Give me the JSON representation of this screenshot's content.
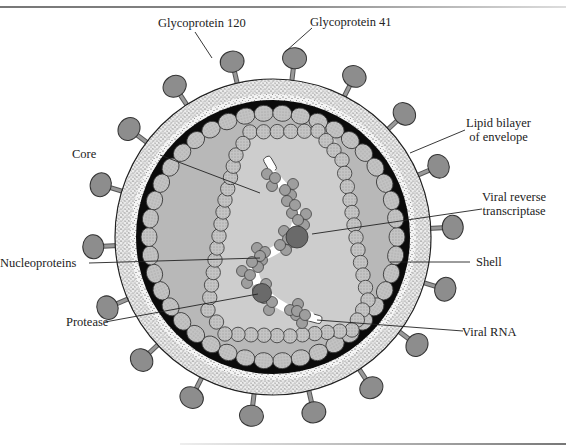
{
  "diagram": {
    "labels": [
      {
        "id": "gp120",
        "text": "Glycoprotein 120"
      },
      {
        "id": "gp41",
        "text": "Glycoprotein 41"
      },
      {
        "id": "lipid",
        "line1": "Lipid bilayer",
        "line2": "of envelope"
      },
      {
        "id": "core",
        "text": "Core"
      },
      {
        "id": "rt",
        "line1": "Viral reverse",
        "line2": "transcriptase"
      },
      {
        "id": "nucleo",
        "text": "Nucleoproteins"
      },
      {
        "id": "shell",
        "text": "Shell"
      },
      {
        "id": "protease",
        "text": "Protease"
      },
      {
        "id": "rna",
        "text": "Viral RNA"
      }
    ],
    "colors": {
      "envelope": "#f2f2f2",
      "stipple": "#333333",
      "matrix_band": "#0a0a0a",
      "shell_fill": "#b9b9b9",
      "core_fill": "#cfcfcf",
      "bead": "#bdbdbd",
      "glycoprotein_head": "#8c8c8c",
      "enzyme": "#6b6b6b",
      "rna": "#ffffff"
    }
  }
}
